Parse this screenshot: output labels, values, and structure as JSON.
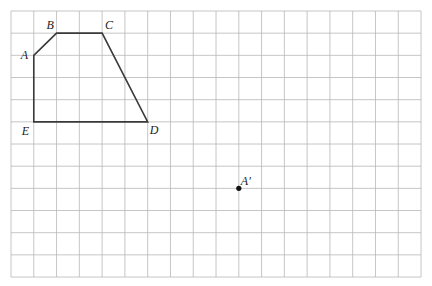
{
  "grid": {
    "origin_px": [
      11,
      11
    ],
    "cols": 18,
    "rows": 12,
    "cell_w": 22.78,
    "cell_h": 22.17,
    "line_color": "#b8b8b8"
  },
  "polygon": {
    "stroke_color": "#3a3a3a",
    "vertices": [
      {
        "name": "A",
        "label": "A",
        "col": 1,
        "row": 2,
        "label_dx": -13,
        "label_dy": 4
      },
      {
        "name": "B",
        "label": "B",
        "col": 2,
        "row": 1,
        "label_dx": -10,
        "label_dy": -4
      },
      {
        "name": "C",
        "label": "C",
        "col": 4,
        "row": 1,
        "label_dx": 3,
        "label_dy": -4
      },
      {
        "name": "D",
        "label": "D",
        "col": 6,
        "row": 5,
        "label_dx": 2,
        "label_dy": 12
      },
      {
        "name": "E",
        "label": "E",
        "col": 1,
        "row": 5,
        "label_dx": -12,
        "label_dy": 13
      }
    ]
  },
  "points": [
    {
      "name": "A-prime",
      "label": "A′",
      "col": 10,
      "row": 8,
      "label_dx": 2,
      "label_dy": -3
    }
  ]
}
